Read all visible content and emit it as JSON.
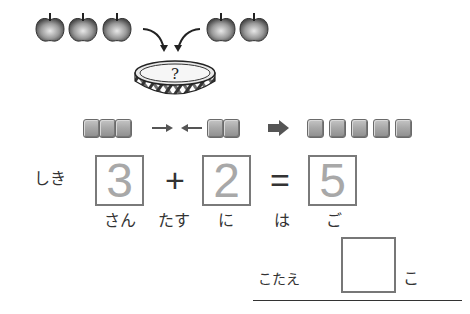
{
  "illustration": {
    "left_apples_count": 3,
    "right_apples_count": 2,
    "basket_label": "?"
  },
  "blocks_row": {
    "left_blocks": 3,
    "right_blocks": 2,
    "result_blocks": 5,
    "arrow_right": "→",
    "arrow_left": "←",
    "result_arrow": "➡"
  },
  "equation": {
    "label": "しき",
    "operand1": "3",
    "operator": "+",
    "operand2": "2",
    "equals": "=",
    "result": "5",
    "readings": [
      "さん",
      "たす",
      "に",
      "は",
      "ご"
    ]
  },
  "answer": {
    "label": "こたえ",
    "value": "",
    "unit": "こ"
  },
  "colors": {
    "digit": "#a8a8a8",
    "box_border": "#7a7a7a",
    "block": "#a9a9a9"
  }
}
